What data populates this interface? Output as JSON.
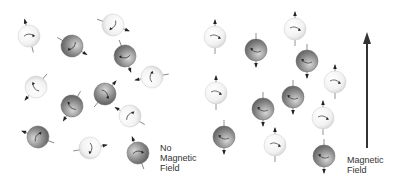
{
  "figure": {
    "left_panel": {
      "label": [
        "No",
        "Magnetic",
        "Field"
      ],
      "spheres": [
        {
          "x": 29,
          "y": 36,
          "shade": "light",
          "angle": -15
        },
        {
          "x": 72,
          "y": 46,
          "shade": "dark",
          "angle": 120
        },
        {
          "x": 113,
          "y": 25,
          "shade": "light",
          "angle": 110
        },
        {
          "x": 125,
          "y": 56,
          "shade": "dark",
          "angle": 160
        },
        {
          "x": 152,
          "y": 77,
          "shade": "light",
          "angle": -100
        },
        {
          "x": 36,
          "y": 87,
          "shade": "light",
          "angle": -140
        },
        {
          "x": 105,
          "y": 94,
          "shade": "dark",
          "angle": 40
        },
        {
          "x": 72,
          "y": 106,
          "shade": "dark",
          "angle": -150
        },
        {
          "x": 130,
          "y": 116,
          "shade": "light",
          "angle": -60
        },
        {
          "x": 38,
          "y": 137,
          "shade": "dark",
          "angle": -70
        },
        {
          "x": 90,
          "y": 148,
          "shade": "light",
          "angle": 80
        },
        {
          "x": 138,
          "y": 153,
          "shade": "dark",
          "angle": -20
        }
      ]
    },
    "right_panel": {
      "label": [
        "Magnetic",
        "Field"
      ],
      "arrow": {
        "x": 167,
        "y_tip": 32,
        "y_tail": 148,
        "color": "#333333"
      },
      "spheres": [
        {
          "x": 15,
          "y": 37,
          "shade": "light",
          "angle": 0
        },
        {
          "x": 56,
          "y": 50,
          "shade": "dark",
          "angle": 180
        },
        {
          "x": 95,
          "y": 29,
          "shade": "light",
          "angle": 0
        },
        {
          "x": 107,
          "y": 61,
          "shade": "dark",
          "angle": 180
        },
        {
          "x": 135,
          "y": 82,
          "shade": "light",
          "angle": 0
        },
        {
          "x": 16,
          "y": 93,
          "shade": "light",
          "angle": 0
        },
        {
          "x": 63,
          "y": 109,
          "shade": "dark",
          "angle": 180
        },
        {
          "x": 93,
          "y": 97,
          "shade": "dark",
          "angle": 180
        },
        {
          "x": 123,
          "y": 118,
          "shade": "light",
          "angle": 0
        },
        {
          "x": 24,
          "y": 137,
          "shade": "dark",
          "angle": 180
        },
        {
          "x": 75,
          "y": 145,
          "shade": "light",
          "angle": 0
        },
        {
          "x": 124,
          "y": 156,
          "shade": "dark",
          "angle": 180
        }
      ]
    },
    "colors": {
      "light_sphere": "#f2f2f2",
      "dark_sphere": "#8a8a8a",
      "arrow": "#333333",
      "text": "#333333"
    }
  }
}
